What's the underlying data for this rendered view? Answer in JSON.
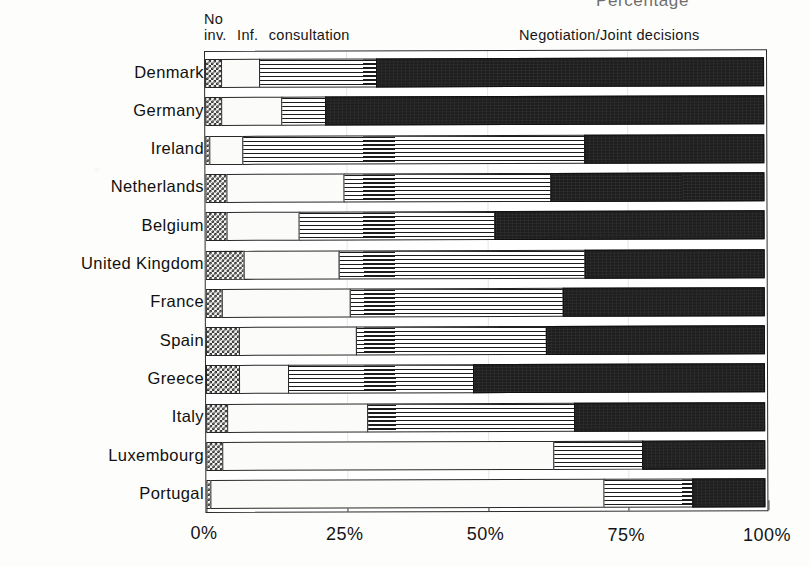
{
  "caption_clipped": "Percentage",
  "legend": {
    "left_line1": "No",
    "left_seg1": "inv.",
    "left_seg2": "Inf.",
    "left_seg3": "consultation",
    "right": "Negotiation/Joint decisions"
  },
  "chart_data": {
    "type": "bar",
    "orientation": "horizontal",
    "stacked": true,
    "stack_mode": "percent",
    "title": "Percentage",
    "xlabel": "",
    "ylabel": "",
    "xlim": [
      0,
      100
    ],
    "xticks": [
      0,
      25,
      50,
      75,
      100
    ],
    "xtick_labels": [
      "0%",
      "25%",
      "50%",
      "75%",
      "100%"
    ],
    "grid": false,
    "legend_position": "top",
    "categories": [
      "Denmark",
      "Germany",
      "Ireland",
      "Netherlands",
      "Belgium",
      "United Kingdom",
      "France",
      "Spain",
      "Greece",
      "Italy",
      "Luxembourg",
      "Portugal"
    ],
    "series": [
      {
        "name": "No inv.",
        "key": "no_involvement",
        "fill": "checkerboard",
        "color": "#2f2f2f",
        "values": [
          3,
          3,
          1,
          4,
          4,
          7,
          3,
          6,
          6,
          4,
          3,
          1
        ]
      },
      {
        "name": "Inf.",
        "key": "information",
        "fill": "stipple",
        "color": "#f6f6f4",
        "values": [
          7,
          11,
          6,
          21,
          13,
          17,
          23,
          21,
          9,
          25,
          59,
          70
        ]
      },
      {
        "name": "consultation",
        "key": "consultation",
        "fill": "horizontal-lines",
        "color": "#ffffff",
        "values": [
          21,
          8,
          61,
          37,
          35,
          44,
          38,
          34,
          33,
          37,
          16,
          16
        ]
      },
      {
        "name": "Negotiation/Joint decisions",
        "key": "negotiation_joint_decisions",
        "fill": "solid-dark",
        "color": "#1e1e1e",
        "values": [
          69,
          78,
          32,
          38,
          48,
          32,
          36,
          39,
          52,
          34,
          22,
          13
        ]
      }
    ],
    "cumulative_boundaries": [
      {
        "category": "Denmark",
        "b1": 3,
        "b2": 10,
        "b3": 31
      },
      {
        "category": "Germany",
        "b1": 3,
        "b2": 14,
        "b3": 22
      },
      {
        "category": "Ireland",
        "b1": 1,
        "b2": 7,
        "b3": 68
      },
      {
        "category": "Netherlands",
        "b1": 4,
        "b2": 25,
        "b3": 62
      },
      {
        "category": "Belgium",
        "b1": 4,
        "b2": 17,
        "b3": 52
      },
      {
        "category": "United Kingdom",
        "b1": 7,
        "b2": 24,
        "b3": 68
      },
      {
        "category": "France",
        "b1": 3,
        "b2": 26,
        "b3": 64
      },
      {
        "category": "Spain",
        "b1": 6,
        "b2": 27,
        "b3": 61
      },
      {
        "category": "Greece",
        "b1": 6,
        "b2": 15,
        "b3": 48
      },
      {
        "category": "Italy",
        "b1": 4,
        "b2": 29,
        "b3": 66
      },
      {
        "category": "Luxembourg",
        "b1": 3,
        "b2": 62,
        "b3": 78
      },
      {
        "category": "Portugal",
        "b1": 1,
        "b2": 71,
        "b3": 87
      }
    ]
  }
}
